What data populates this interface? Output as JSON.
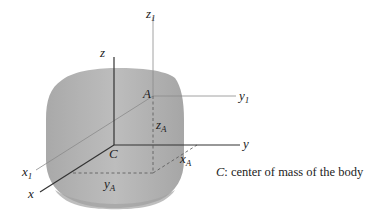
{
  "figure": {
    "body_fill": "#b4b4b4",
    "body_shade": "#9c9c9c",
    "axis_color": "#333333",
    "thin_axis_color": "#888888",
    "points": {
      "C": "C",
      "A": "A"
    },
    "axes": {
      "x": {
        "name": "x",
        "sub": ""
      },
      "y": {
        "name": "y",
        "sub": ""
      },
      "z": {
        "name": "z",
        "sub": ""
      },
      "x1": {
        "name": "x",
        "sub": "1"
      },
      "y1": {
        "name": "y",
        "sub": "1"
      },
      "z1": {
        "name": "z",
        "sub": "1"
      }
    },
    "offsets": {
      "xA": {
        "name": "x",
        "sub": "A"
      },
      "yA": {
        "name": "y",
        "sub": "A"
      },
      "zA": {
        "name": "z",
        "sub": "A"
      }
    },
    "caption": {
      "symbol": "C",
      "text": ": center of mass of the body"
    }
  }
}
